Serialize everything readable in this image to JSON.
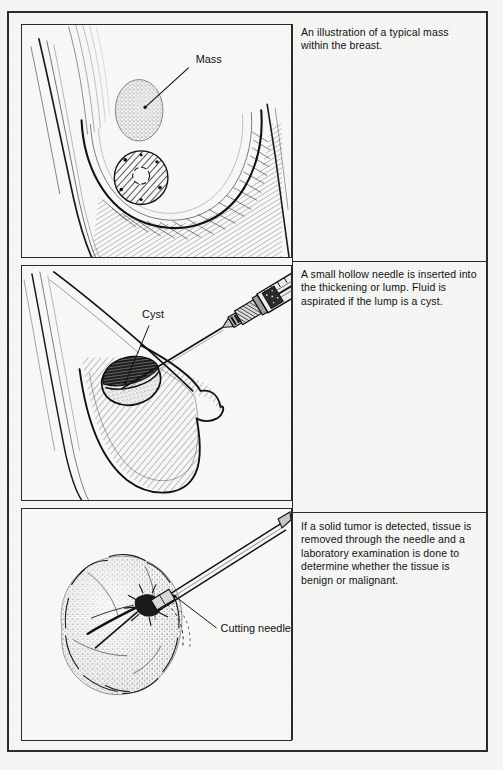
{
  "figure": {
    "background_color": "#f6f6f5",
    "ink_color": "#1a1a1a",
    "border_color": "#2a2a2a"
  },
  "panels": [
    {
      "id": "panel-1",
      "illustration_name": "breast-with-mass-illustration",
      "label": "Mass",
      "label_name": "mass-label",
      "caption": "An illustration of a typical mass within the breast."
    },
    {
      "id": "panel-2",
      "illustration_name": "needle-aspiration-of-cyst-illustration",
      "label": "Cyst",
      "label_name": "cyst-label",
      "caption": "A small hollow needle is inserted into the thickening or lump. Fluid is aspirated if the lump is a cyst."
    },
    {
      "id": "panel-3",
      "illustration_name": "cutting-needle-biopsy-of-tumor-illustration",
      "label": "Cutting needle",
      "label_name": "cutting-needle-label",
      "caption": "If a solid tumor is detected, tissue is removed through the needle and a laboratory examination is done to determine whether the tissue is benign or malignant."
    }
  ]
}
